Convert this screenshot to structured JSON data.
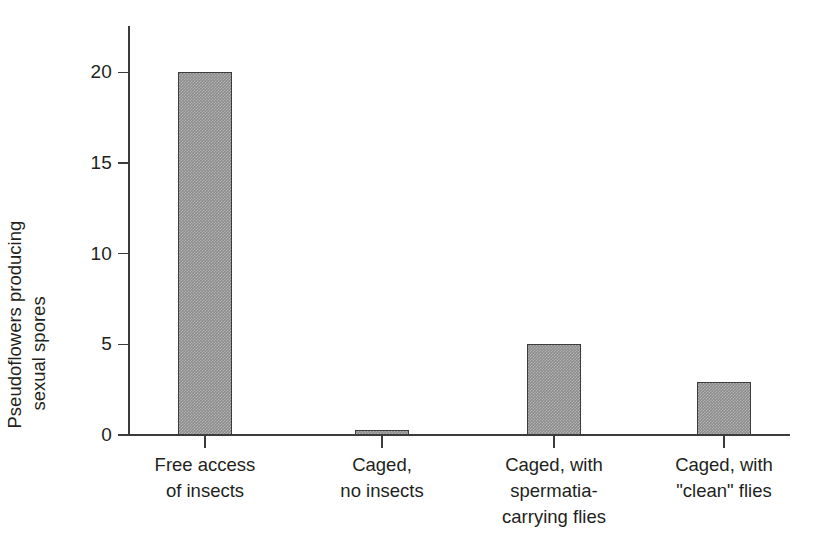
{
  "chart_data": {
    "type": "bar",
    "title": "",
    "subtitle": "",
    "xlabel": "",
    "ylabel": "Pseudoflowers producing sexual spores",
    "ylabel_lines": [
      "Pseudoflowers producing",
      "sexual spores"
    ],
    "categories": [
      "Free access\nof insects",
      "Caged,\nno insects",
      "Caged, with\nspermatia-\ncarrying flies",
      "Caged, with\n\"clean\" flies"
    ],
    "category_labels_flat": [
      "Free access of insects",
      "Caged, no insects",
      "Caged, with spermatia-carrying flies",
      "Caged, with \"clean\" flies"
    ],
    "values": [
      20,
      0.3,
      5,
      2.9
    ],
    "ylim": [
      0,
      22.5
    ],
    "yticks": [
      0,
      5,
      10,
      15,
      20
    ],
    "ytick_labels": [
      "0",
      "5",
      "10",
      "15",
      "20"
    ],
    "grid": false,
    "legend": null,
    "bar_fill_color": "#8c8c8c",
    "bar_edge_color": "#3c3c3c",
    "axis_color": "#3b3b3b",
    "background_color": "#ffffff",
    "text_color": "#231f20"
  }
}
